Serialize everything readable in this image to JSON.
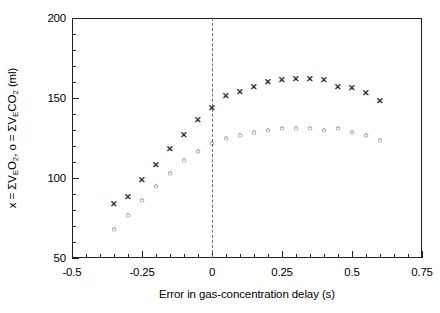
{
  "chart_data": {
    "type": "scatter",
    "title": "",
    "xlabel": "Error in gas-concentration delay (s)",
    "ylabel": "x = ΣVₑO₂, o = ΣVₑCO₂ (ml)",
    "ylabel_parts": {
      "prefix_x": "x = ΣV",
      "sub_e1": "E",
      "o2": "O",
      "sub_2a": "2",
      "mid": ", o = ΣV",
      "sub_e2": "E",
      "co2": "CO",
      "sub_2b": "2",
      "units": " (ml)"
    },
    "xlim": [
      -0.5,
      0.75
    ],
    "ylim": [
      50,
      200
    ],
    "x_major_ticks": [
      -0.5,
      -0.25,
      0,
      0.25,
      0.5,
      0.75
    ],
    "x_tick_labels": [
      "-0.5",
      "-0.25",
      "0",
      "0.25",
      "0.5",
      "0.75"
    ],
    "x_minor_step": 0.05,
    "y_major_ticks": [
      50,
      100,
      150,
      200
    ],
    "y_tick_labels": [
      "50",
      "100",
      "150",
      "200"
    ],
    "y_minor_step": 10,
    "grid": false,
    "legend": "none",
    "annotations": [
      {
        "name": "zero-reference-line",
        "type": "vline",
        "x": 0,
        "style": "dashed",
        "color": "#6f6f6f"
      }
    ],
    "series": [
      {
        "name": "ΣV_E O_2",
        "marker": "x",
        "marker_glyph": "✕",
        "color": "#2b2b2b",
        "points": [
          {
            "x": -0.35,
            "y": 84
          },
          {
            "x": -0.3,
            "y": 88
          },
          {
            "x": -0.25,
            "y": 99
          },
          {
            "x": -0.2,
            "y": 108
          },
          {
            "x": -0.15,
            "y": 118
          },
          {
            "x": -0.1,
            "y": 127
          },
          {
            "x": -0.05,
            "y": 136
          },
          {
            "x": 0.0,
            "y": 144
          },
          {
            "x": 0.05,
            "y": 151
          },
          {
            "x": 0.1,
            "y": 154
          },
          {
            "x": 0.15,
            "y": 157
          },
          {
            "x": 0.2,
            "y": 160
          },
          {
            "x": 0.25,
            "y": 161
          },
          {
            "x": 0.3,
            "y": 162
          },
          {
            "x": 0.35,
            "y": 162
          },
          {
            "x": 0.4,
            "y": 161
          },
          {
            "x": 0.45,
            "y": 157
          },
          {
            "x": 0.5,
            "y": 156
          },
          {
            "x": 0.55,
            "y": 153
          },
          {
            "x": 0.6,
            "y": 148
          }
        ]
      },
      {
        "name": "ΣV_E CO_2",
        "marker": "o",
        "marker_glyph": "○",
        "color": "#2b2b2b",
        "points": [
          {
            "x": -0.35,
            "y": 68
          },
          {
            "x": -0.3,
            "y": 77
          },
          {
            "x": -0.25,
            "y": 86
          },
          {
            "x": -0.2,
            "y": 95
          },
          {
            "x": -0.15,
            "y": 103
          },
          {
            "x": -0.1,
            "y": 111
          },
          {
            "x": -0.05,
            "y": 117
          },
          {
            "x": 0.0,
            "y": 122
          },
          {
            "x": 0.05,
            "y": 125
          },
          {
            "x": 0.1,
            "y": 127
          },
          {
            "x": 0.15,
            "y": 129
          },
          {
            "x": 0.2,
            "y": 130
          },
          {
            "x": 0.25,
            "y": 131
          },
          {
            "x": 0.3,
            "y": 131
          },
          {
            "x": 0.35,
            "y": 131
          },
          {
            "x": 0.4,
            "y": 130
          },
          {
            "x": 0.45,
            "y": 131
          },
          {
            "x": 0.5,
            "y": 129
          },
          {
            "x": 0.55,
            "y": 127
          },
          {
            "x": 0.6,
            "y": 124
          }
        ]
      }
    ]
  }
}
